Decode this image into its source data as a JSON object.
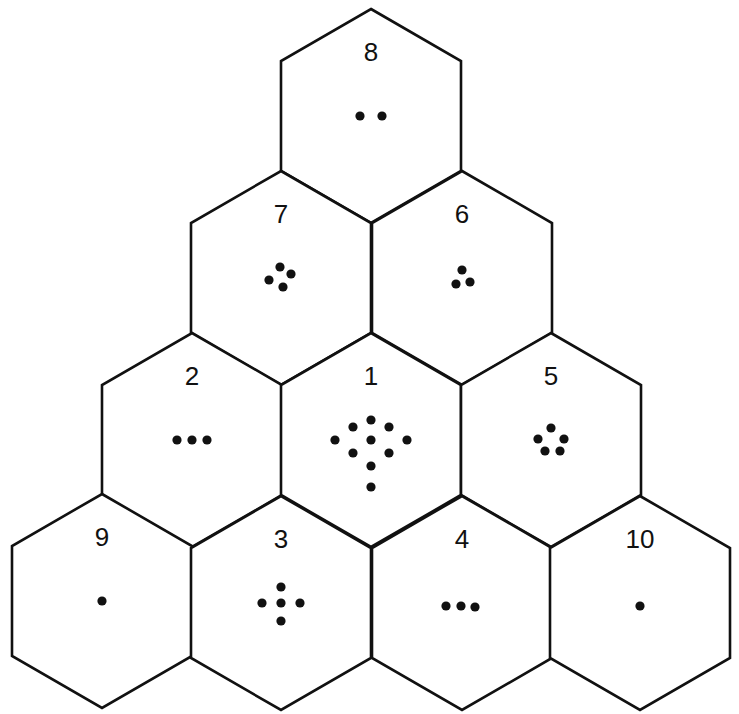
{
  "diagram": {
    "colors": {
      "stroke": "#111111",
      "fill": "#ffffff",
      "dot": "#111111"
    },
    "hex": {
      "half_width": 90,
      "edge_half": 55,
      "cap": 52
    },
    "cells": [
      {
        "label": "8",
        "cx": 371,
        "cy": 116,
        "dots": 2,
        "pattern": [
          [
            -11,
            0
          ],
          [
            11,
            0
          ]
        ]
      },
      {
        "label": "7",
        "cx": 281,
        "cy": 278,
        "dots": 4,
        "pattern": [
          [
            -1,
            -11
          ],
          [
            10,
            -4
          ],
          [
            -12,
            2
          ],
          [
            2,
            9
          ]
        ]
      },
      {
        "label": "6",
        "cx": 462,
        "cy": 278,
        "dots": 3,
        "pattern": [
          [
            0,
            -8
          ],
          [
            -6,
            6
          ],
          [
            8,
            4
          ]
        ]
      },
      {
        "label": "2",
        "cx": 192,
        "cy": 440,
        "dots": 3,
        "pattern": [
          [
            -15,
            0
          ],
          [
            0,
            0
          ],
          [
            15,
            0
          ]
        ]
      },
      {
        "label": "1",
        "cx": 371,
        "cy": 440,
        "dots": 10,
        "pattern": [
          [
            0,
            -20
          ],
          [
            -18,
            -13
          ],
          [
            18,
            -13
          ],
          [
            -36,
            0
          ],
          [
            0,
            0
          ],
          [
            36,
            0
          ],
          [
            -18,
            13
          ],
          [
            18,
            13
          ],
          [
            0,
            26
          ],
          [
            0,
            47
          ]
        ]
      },
      {
        "label": "5",
        "cx": 551,
        "cy": 440,
        "dots": 5,
        "pattern": [
          [
            0,
            -12
          ],
          [
            -13,
            -1
          ],
          [
            13,
            -1
          ],
          [
            -6,
            11
          ],
          [
            9,
            11
          ]
        ]
      },
      {
        "label": "9",
        "cx": 102,
        "cy": 601,
        "dots": 1,
        "pattern": [
          [
            0,
            0
          ]
        ]
      },
      {
        "label": "3",
        "cx": 281,
        "cy": 603,
        "dots": 5,
        "pattern": [
          [
            0,
            -16
          ],
          [
            -19,
            0
          ],
          [
            0,
            0
          ],
          [
            19,
            0
          ],
          [
            0,
            18
          ]
        ]
      },
      {
        "label": "4",
        "cx": 462,
        "cy": 603,
        "dots": 3,
        "pattern": [
          [
            -16,
            3
          ],
          [
            -1,
            3
          ],
          [
            13,
            4
          ]
        ]
      },
      {
        "label": "10",
        "cx": 640,
        "cy": 603,
        "dots": 1,
        "pattern": [
          [
            0,
            3
          ]
        ]
      }
    ],
    "label_offset_y": -64,
    "pattern_offset_y": 0
  }
}
